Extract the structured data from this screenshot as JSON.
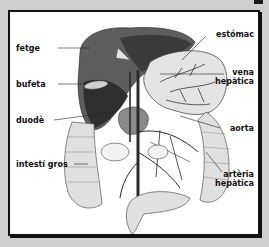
{
  "figure": {
    "labels_left": [
      {
        "id": "fetge",
        "text": "fetge"
      },
      {
        "id": "bufeta",
        "text": "bufeta"
      },
      {
        "id": "duode",
        "text": "duodè"
      },
      {
        "id": "intesti-gros",
        "text": "intestí gros"
      }
    ],
    "labels_right": [
      {
        "id": "estomac",
        "lines": [
          "estómac"
        ]
      },
      {
        "id": "vena-hepatica",
        "lines": [
          "vena",
          "hepàtica"
        ]
      },
      {
        "id": "aorta",
        "lines": [
          "aorta"
        ]
      },
      {
        "id": "arteria-hepatica",
        "lines": [
          "artèria",
          "hepàtica"
        ]
      }
    ]
  },
  "colors": {
    "background": "#cfcfcf",
    "frame_border": "#111111",
    "panel": "#ffffff",
    "liver_dark": "#3c3c3c",
    "liver_mid": "#6b6b6b",
    "organ_light": "#d9d9d9",
    "vessel": "#2a2a2a"
  }
}
